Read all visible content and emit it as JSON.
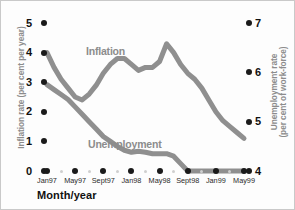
{
  "chart_data": {
    "type": "line",
    "title": "",
    "xlabel": "Month/year",
    "x": [
      "Jan97",
      "Feb97",
      "Mar97",
      "Apr97",
      "May97",
      "Jun97",
      "Jul97",
      "Aug97",
      "Sept97",
      "Oct97",
      "Nov97",
      "Dec97",
      "Jan98",
      "Feb98",
      "Mar98",
      "Apr98",
      "May98",
      "Jun98",
      "Jul98",
      "Aug98",
      "Sept98",
      "Oct98",
      "Nov98",
      "Dec98",
      "Jan99",
      "Feb99",
      "Mar99",
      "Apr99",
      "May99"
    ],
    "xtick_labels": [
      "Jan97",
      "May97",
      "Sept97",
      "Jan98",
      "May98",
      "Sept98",
      "Jan99",
      "May99"
    ],
    "grid": false,
    "legend": "inline-labels",
    "axes": [
      {
        "side": "left",
        "label": "Inflation rate (per cent per year)",
        "ticks": [
          0,
          1,
          2,
          3,
          4,
          5
        ],
        "ylim": [
          0,
          5
        ]
      },
      {
        "side": "right",
        "label": "Unemployment rate (per cent of work-force)",
        "ticks": [
          4,
          5,
          6,
          7
        ],
        "ylim": [
          4,
          7
        ]
      }
    ],
    "series": [
      {
        "name": "Inflation",
        "axis": "left",
        "unit": "per cent per year",
        "color": "#8f8f8f",
        "values": [
          4.0,
          3.5,
          3.1,
          2.8,
          2.5,
          2.4,
          2.6,
          2.9,
          3.3,
          3.6,
          3.8,
          3.8,
          3.6,
          3.4,
          3.5,
          3.5,
          3.7,
          4.3,
          4.0,
          3.6,
          3.3,
          3.1,
          2.8,
          2.4,
          2.0,
          1.7,
          1.5,
          1.3,
          1.1
        ]
      },
      {
        "name": "Unemployment",
        "axis": "right",
        "unit": "per cent of work-force",
        "color": "#a6a6a6",
        "values": [
          5.75,
          5.65,
          5.55,
          5.45,
          5.3,
          5.15,
          5.0,
          4.85,
          4.7,
          4.6,
          4.5,
          4.42,
          4.38,
          4.4,
          4.38,
          4.35,
          4.35,
          4.35,
          4.3,
          4.15,
          4.0,
          4.0,
          4.0,
          4.0,
          4.0,
          4.0,
          4.0,
          4.0,
          4.0
        ]
      }
    ]
  },
  "axis_left": {
    "title": "Inflation rate (per cent per year)",
    "ticks": [
      {
        "label": "5"
      },
      {
        "label": "4"
      },
      {
        "label": "3"
      },
      {
        "label": "2"
      },
      {
        "label": "1"
      },
      {
        "label": "0"
      }
    ]
  },
  "axis_right": {
    "title": "Unemployment rate (per cent of work-force)",
    "title_line1": "Unemployment rate",
    "title_line2": "(per cent of work-force)",
    "ticks": [
      {
        "label": "7"
      },
      {
        "label": "6"
      },
      {
        "label": "5"
      },
      {
        "label": "4"
      }
    ]
  },
  "axis_x": {
    "title": "Month/year",
    "ticks": [
      {
        "label": "Jan97"
      },
      {
        "label": "May97"
      },
      {
        "label": "Sept97"
      },
      {
        "label": "Jan98"
      },
      {
        "label": "May98"
      },
      {
        "label": "Sept98"
      },
      {
        "label": "Jan99"
      },
      {
        "label": "May99"
      }
    ]
  },
  "series_labels": {
    "inflation": "Inflation",
    "unemployment": "Unemployment"
  },
  "colors": {
    "inflation_line": "#8f8f8f",
    "unemployment_line": "#a6a6a6",
    "tick_dot": "#1a1a1a",
    "axis_title": "#8c8c8c",
    "background": "#fdfdfd",
    "frame": "#c9c9c9"
  }
}
